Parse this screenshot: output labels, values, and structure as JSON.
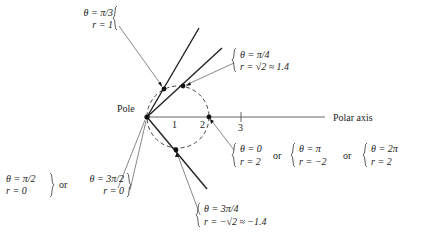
{
  "diagram": {
    "pole_label": "Pole",
    "axis_label": "Polar axis",
    "axis_ticks": [
      "1",
      "2",
      "3"
    ],
    "or": "or",
    "annotations": {
      "pi3": {
        "theta": "θ = π/3",
        "r": "r = 1"
      },
      "pi4": {
        "theta": "θ = π/4",
        "r": "r = √2 ≈ 1.4"
      },
      "zero": [
        {
          "theta": "θ = 0",
          "r": "r = 2"
        },
        {
          "theta": "θ = π",
          "r": "r = −2"
        },
        {
          "theta": "θ = 2π",
          "r": "r = 2"
        }
      ],
      "pole": [
        {
          "theta": "θ = π/2",
          "r": "r = 0"
        },
        {
          "theta": "θ = 3π/2",
          "r": "r = 0"
        }
      ],
      "threepi4": {
        "theta": "θ = 3π/4",
        "r": "r = −√2 ≈ −1.4"
      }
    },
    "colors": {
      "ink": "#222222",
      "background": "#ffffff"
    }
  }
}
